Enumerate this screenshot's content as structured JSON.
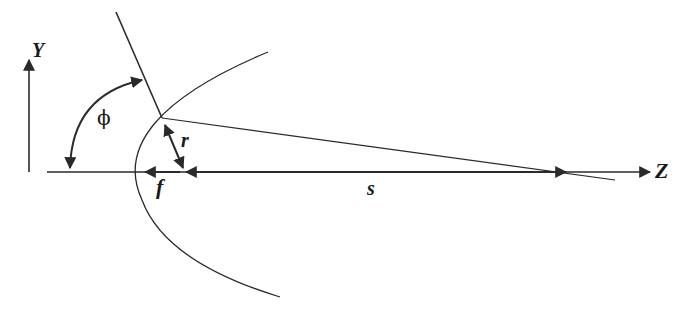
{
  "diagram": {
    "labels": {
      "y_axis": "Y",
      "z_axis": "Z",
      "angle": "ϕ",
      "radius": "r",
      "focal_length": "f",
      "distance": "s"
    },
    "colors": {
      "stroke": "#2a2a2a",
      "background": "#ffffff"
    }
  }
}
